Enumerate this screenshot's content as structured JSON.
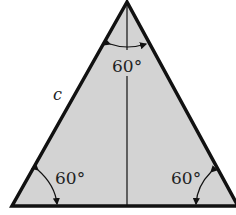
{
  "diagram": {
    "shape": "equilateral triangle",
    "fill_color": "#d3d3d3",
    "stroke_color": "#111111",
    "side_label": "c",
    "angles": {
      "top": "60°",
      "bottom_left": "60°",
      "bottom_right": "60°"
    }
  }
}
